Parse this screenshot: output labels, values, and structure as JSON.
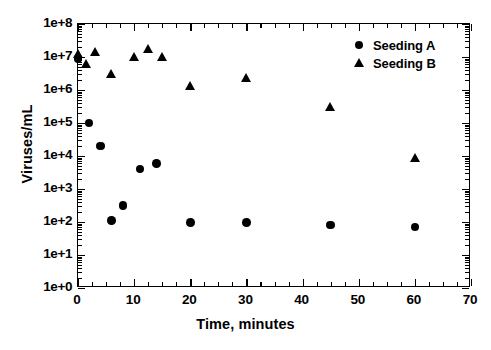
{
  "chart_data": {
    "type": "scatter",
    "title": "",
    "xlabel": "Time, minutes",
    "ylabel": "Viruses/mL",
    "xlim": [
      0,
      70
    ],
    "ylim": [
      1,
      100000000
    ],
    "yscale": "log",
    "grid": false,
    "legend_position": "top-right",
    "xticks": [
      0,
      10,
      20,
      30,
      40,
      50,
      60,
      70
    ],
    "xtick_labels": [
      "0",
      "10",
      "20",
      "30",
      "40",
      "50",
      "60",
      "70"
    ],
    "yticks": [
      1,
      10,
      100,
      1000,
      10000,
      100000,
      1000000,
      10000000,
      100000000
    ],
    "ytick_labels": [
      "1e+0",
      "1e+1",
      "1e+2",
      "1e+3",
      "1e+4",
      "1e+5",
      "1e+6",
      "1e+7",
      "1e+8"
    ],
    "series": [
      {
        "name": "Seeding A",
        "marker": "circle",
        "color": "#000000",
        "points": [
          {
            "x": 0,
            "y": 9000000
          },
          {
            "x": 2,
            "y": 100000
          },
          {
            "x": 4,
            "y": 20000
          },
          {
            "x": 6,
            "y": 110
          },
          {
            "x": 8,
            "y": 320
          },
          {
            "x": 11,
            "y": 4000
          },
          {
            "x": 14,
            "y": 6000
          },
          {
            "x": 20,
            "y": 95
          },
          {
            "x": 30,
            "y": 95
          },
          {
            "x": 45,
            "y": 80
          },
          {
            "x": 60,
            "y": 70
          }
        ]
      },
      {
        "name": "Seeding B",
        "marker": "triangle",
        "color": "#000000",
        "points": [
          {
            "x": 0,
            "y": 12000000
          },
          {
            "x": 1.5,
            "y": 6000000
          },
          {
            "x": 3,
            "y": 14000000
          },
          {
            "x": 6,
            "y": 3000000
          },
          {
            "x": 10,
            "y": 10000000
          },
          {
            "x": 12.5,
            "y": 18000000
          },
          {
            "x": 15,
            "y": 10000000
          },
          {
            "x": 20,
            "y": 1300000
          },
          {
            "x": 30,
            "y": 2300000
          },
          {
            "x": 45,
            "y": 300000
          },
          {
            "x": 60,
            "y": 9000
          }
        ]
      }
    ]
  },
  "legend": {
    "entries": [
      {
        "label": "Seeding A",
        "marker": "circle"
      },
      {
        "label": "Seeding B",
        "marker": "triangle"
      }
    ]
  }
}
